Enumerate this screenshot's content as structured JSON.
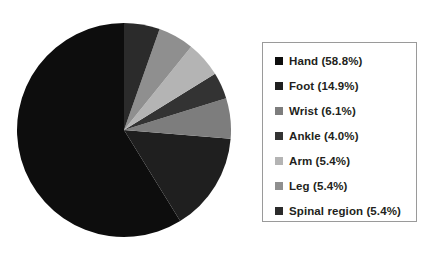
{
  "chart_data": {
    "type": "pie",
    "title": "",
    "subtitle": "",
    "xlabel": "",
    "ylabel": "",
    "grid": false,
    "legend_position": "right",
    "start_angle_deg": 0,
    "direction": "clockwise",
    "categories": [
      "Hand",
      "Foot",
      "Wrist",
      "Ankle",
      "Arm",
      "Leg",
      "Spinal region"
    ],
    "values": [
      58.8,
      14.9,
      6.1,
      4.0,
      5.4,
      5.4,
      5.4
    ],
    "value_unit": "%",
    "colors": [
      "#0d0d0d",
      "#1f1f1f",
      "#7d7d7d",
      "#333333",
      "#b4b4b4",
      "#8f8f8f",
      "#2b2b2b"
    ],
    "slices": [
      {
        "label": "Hand",
        "value": 58.8,
        "color": "#0d0d0d",
        "legend_text": "Hand (58.8%)"
      },
      {
        "label": "Foot",
        "value": 14.9,
        "color": "#1f1f1f",
        "legend_text": "Foot (14.9%)"
      },
      {
        "label": "Wrist",
        "value": 6.1,
        "color": "#7d7d7d",
        "legend_text": "Wrist (6.1%)"
      },
      {
        "label": "Ankle",
        "value": 4.0,
        "color": "#333333",
        "legend_text": "Ankle (4.0%)"
      },
      {
        "label": "Arm",
        "value": 5.4,
        "color": "#b4b4b4",
        "legend_text": "Arm (5.4%)"
      },
      {
        "label": "Leg",
        "value": 5.4,
        "color": "#8f8f8f",
        "legend_text": "Leg (5.4%)"
      },
      {
        "label": "Spinal region",
        "value": 5.4,
        "color": "#2b2b2b",
        "legend_text": "Spinal region (5.4%)"
      }
    ]
  },
  "legend": {
    "border_color": "#9a9a9a",
    "items": [
      {
        "marker": "legend-marker-hand",
        "text": "Hand (58.8%)",
        "color": "#0d0d0d"
      },
      {
        "marker": "legend-marker-foot",
        "text": "Foot (14.9%)",
        "color": "#1f1f1f"
      },
      {
        "marker": "legend-marker-wrist",
        "text": "Wrist (6.1%)",
        "color": "#7d7d7d"
      },
      {
        "marker": "legend-marker-ankle",
        "text": "Ankle (4.0%)",
        "color": "#333333"
      },
      {
        "marker": "legend-marker-arm",
        "text": "Arm (5.4%)",
        "color": "#b4b4b4"
      },
      {
        "marker": "legend-marker-leg",
        "text": "Leg (5.4%)",
        "color": "#8f8f8f"
      },
      {
        "marker": "legend-marker-spinal-region",
        "text": "Spinal region (5.4%)",
        "color": "#2b2b2b"
      }
    ]
  },
  "figure": {
    "background": "#ffffff",
    "pie_center_x": 108,
    "pie_center_y": 114,
    "pie_radius": 107
  }
}
